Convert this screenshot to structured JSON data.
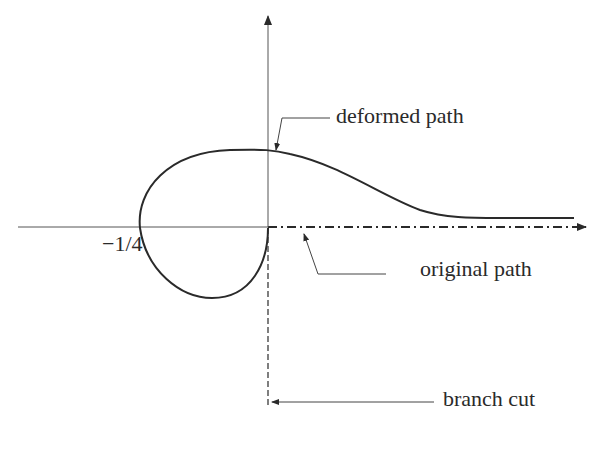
{
  "diagram": {
    "labels": {
      "deformed_path": "deformed path",
      "original_path": "original path",
      "branch_cut": "branch cut",
      "branch_point": "−1/4"
    },
    "axes": {
      "horizontal": "real axis (arrow to right)",
      "vertical": "imaginary axis (arrow up)"
    },
    "colors": {
      "ink": "#2a2a2a",
      "background": "#ffffff"
    }
  }
}
